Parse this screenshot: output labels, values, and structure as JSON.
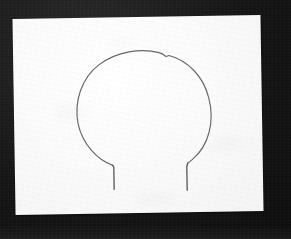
{
  "scene": {
    "type": "photograph",
    "subject": "hand-drawn pencil sketch on paper",
    "background_label": "dark surface",
    "paper_label": "white sheet of paper",
    "drawing_label": "balloon outline sketch"
  },
  "colors": {
    "background_dark": "#151515",
    "background_edge": "#0d0d0d",
    "paper_white": "#fbfbfb",
    "pencil_line": "#5a5a5e",
    "pencil_line_dark": "#4e4e52"
  },
  "geometry": {
    "image_width": 291,
    "image_height": 239,
    "paper_left": 14,
    "paper_top": 17,
    "paper_width": 248,
    "paper_height": 196,
    "paper_rotation_deg": -0.9
  },
  "drawing": {
    "name": "balloon-outline",
    "description": "rounded closed curve with a small angular kink near the top right, opening at the bottom into two short vertical neck lines",
    "body_path": "M 98 148 C 82 142, 68 126, 64 106 C 60 84, 68 60, 86 47 C 104 34, 128 31, 146 36 C 150 37, 152 39, 153 40 L 156 39 C 174 44, 190 60, 195 82 C 201 106, 194 130, 178 143 C 176 145, 174 146, 173 147",
    "neck_left_path": "M 98 148 L 99 150 L 99 172",
    "neck_right_path": "M 173 147 L 172 150 L 172 174",
    "stroke_color": "#5a5a5e",
    "stroke_width": 1.15
  },
  "smudges": [
    {
      "name": "smudge-top-center",
      "left": 96,
      "top": 22,
      "width": 26,
      "height": 10
    },
    {
      "name": "smudge-mid-left",
      "left": 40,
      "top": 88,
      "width": 34,
      "height": 14
    },
    {
      "name": "smudge-bottom-center",
      "left": 120,
      "top": 176,
      "width": 40,
      "height": 12
    },
    {
      "name": "smudge-right",
      "left": 196,
      "top": 120,
      "width": 28,
      "height": 16
    }
  ]
}
